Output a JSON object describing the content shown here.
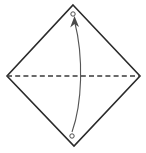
{
  "figure": {
    "caption": "",
    "background_color": "#ffffff",
    "width": 146,
    "height": 153
  },
  "shape": {
    "name": "square-sheet-diamond-orientation",
    "stroke_color": "#2b2b2b",
    "fill_color": "#ffffff",
    "stroke_width": 1.6,
    "vertices": [
      {
        "label": "top",
        "x": 73,
        "y": 5
      },
      {
        "label": "right",
        "x": 140,
        "y": 76
      },
      {
        "label": "bottom",
        "x": 74,
        "y": 146
      },
      {
        "label": "left",
        "x": 7,
        "y": 76
      }
    ],
    "points_path": "73,5 140,76 74,146 7,76"
  },
  "fold_line": {
    "name": "horizontal-crease",
    "style": "dashed",
    "color": "#3a3a3a",
    "dash_pattern": "5 3.2",
    "stroke_width": 1.5,
    "x1": 7,
    "y1": 76,
    "x2": 140,
    "y2": 76
  },
  "motion_arrow": {
    "name": "fold-up-arrow",
    "color": "#555555",
    "stroke_width": 1.1,
    "direction": "bottom-to-top",
    "start": {
      "x": 72,
      "y": 132
    },
    "end": {
      "x": 74,
      "y": 20
    },
    "path": "M 72 132 C 82 104 84 58 74.5 21",
    "head_points": "74.5,16 79,27 74.5,24 70.2,27.5"
  },
  "markers": [
    {
      "name": "top-reference-point",
      "cx": 73,
      "cy": 14,
      "r": 2.2,
      "fill": "#ffffff",
      "stroke": "#3a3a3a"
    },
    {
      "name": "bottom-reference-point",
      "cx": 72,
      "cy": 136,
      "r": 2.2,
      "fill": "#ffffff",
      "stroke": "#3a3a3a"
    }
  ],
  "accessibility": {
    "description": "Origami instruction diagram: a square sheet rotated 45 degrees forms a diamond. A horizontal dashed crease line joins the left and right corners. A curved arrow sweeps from a small circle near the bottom corner upward to a small circle near the top corner, showing the bottom corner folding up to meet the top corner."
  }
}
